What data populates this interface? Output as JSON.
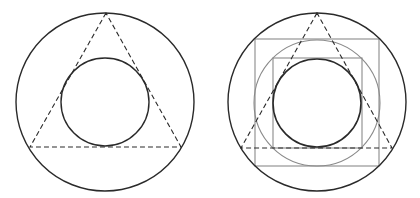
{
  "diagram": {
    "colors": {
      "primary_stroke": "#2a2a2a",
      "secondary_stroke": "#8a8a8a",
      "background": "#ffffff"
    },
    "figures": [
      {
        "id": "left",
        "outer_circle": {
          "cx": 105,
          "cy": 102,
          "r": 89
        },
        "inner_circle": {
          "cx": 105,
          "cy": 102,
          "r": 44
        },
        "triangle": {
          "points": [
            [
              106,
              13
            ],
            [
              30,
              147
            ],
            [
              181,
              147
            ]
          ],
          "style": "dashed"
        }
      },
      {
        "id": "right",
        "outer_circle": {
          "cx": 317,
          "cy": 102,
          "r": 89
        },
        "middle_circle": {
          "cx": 317,
          "cy": 103,
          "r": 63
        },
        "inner_circle": {
          "cx": 317,
          "cy": 103,
          "r": 44
        },
        "outer_square": {
          "x": 255,
          "y": 39,
          "w": 124,
          "h": 127
        },
        "inner_square": {
          "x": 273,
          "y": 58,
          "w": 89,
          "h": 90
        },
        "triangle": {
          "points": [
            [
              317,
              13
            ],
            [
              241,
              148
            ],
            [
              392,
              148
            ]
          ],
          "style": "dashed"
        }
      }
    ]
  }
}
